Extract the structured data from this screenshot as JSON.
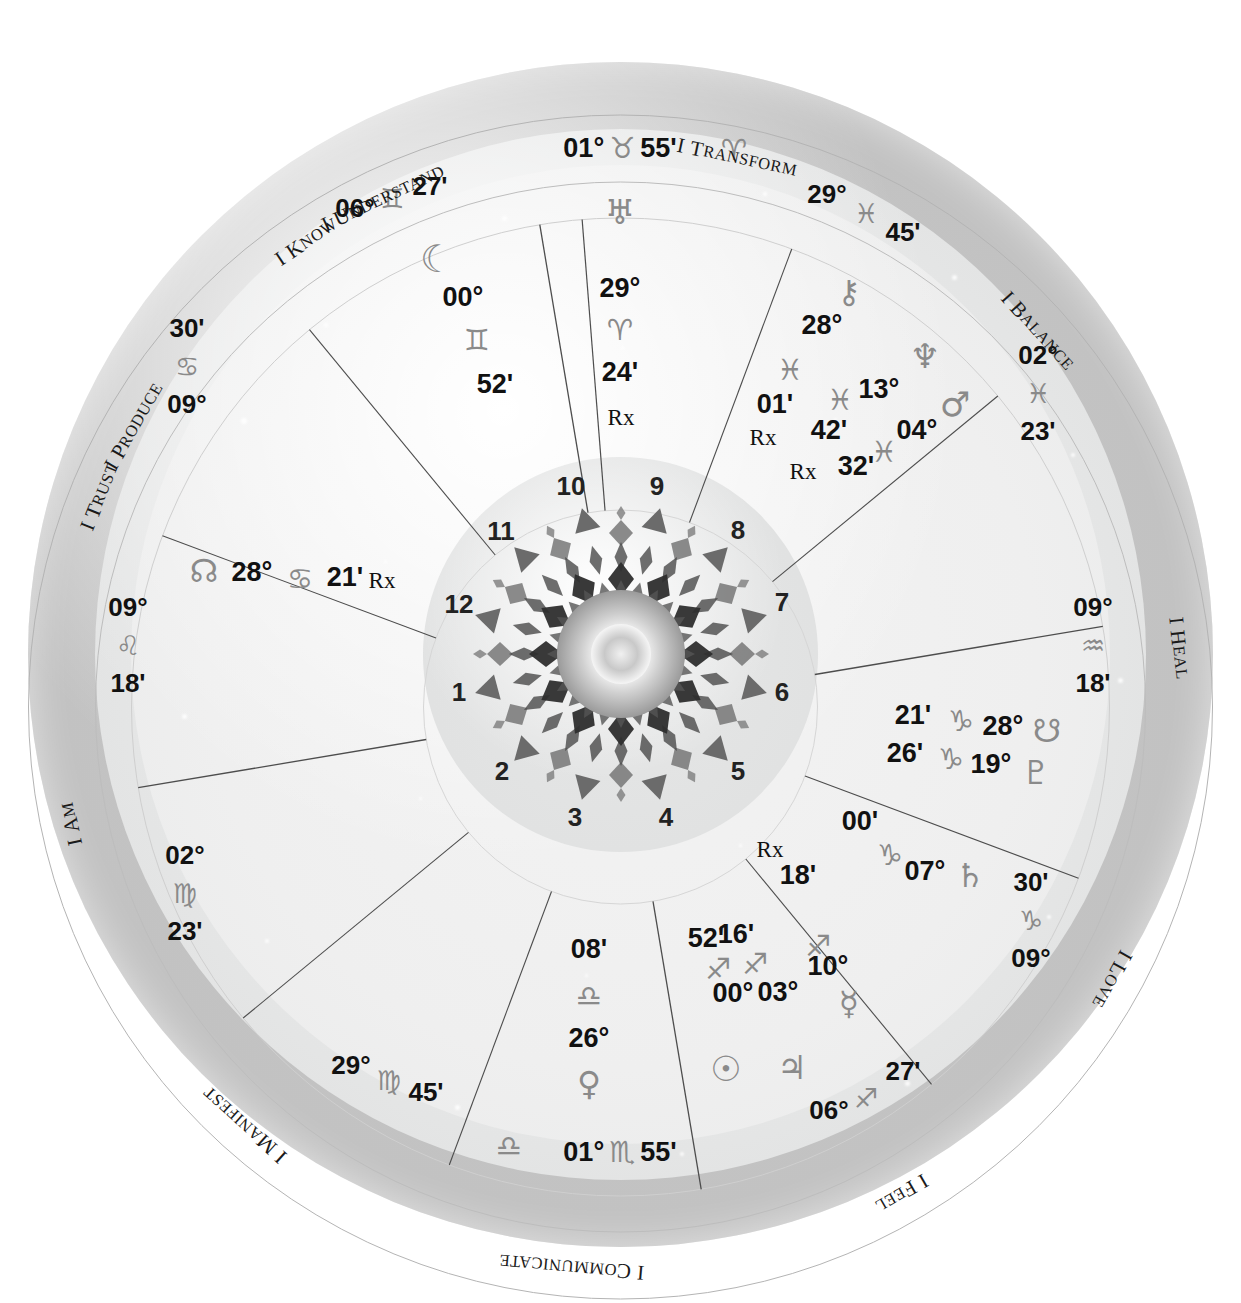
{
  "chart": {
    "type": "natal-wheel",
    "house_system": "12 equal sectors",
    "colors": {
      "text": "#111111",
      "glyph": "#8a8a8a",
      "outer_ring": "#c4c4c4",
      "zodiac_ring": "#e7e8e8",
      "house_ring": "#efefef",
      "inner_disc": "#e1e2e2",
      "line": "#555555"
    }
  },
  "keywords": [
    {
      "label": "I Produce",
      "angle": -60
    },
    {
      "label": "I Understand",
      "angle": -25
    },
    {
      "label": "I Transform",
      "angle": 12
    },
    {
      "label": "I Balance",
      "angle": 48
    },
    {
      "label": "I Heal",
      "angle": 84
    },
    {
      "label": "I Love",
      "angle": 119
    },
    {
      "label": "I Feel",
      "angle": 150
    },
    {
      "label": "I Communicate",
      "angle": 185
    },
    {
      "label": "I Manifest",
      "angle": 222
    },
    {
      "label": "I Am",
      "angle": 258
    },
    {
      "label": "I Trust",
      "angle": 292
    },
    {
      "label": "I Know",
      "angle": 326
    }
  ],
  "house_numbers": [
    "1",
    "2",
    "3",
    "4",
    "5",
    "6",
    "7",
    "8",
    "9",
    "10",
    "11",
    "12"
  ],
  "angles": {
    "mc": {
      "name": "Midheaven",
      "degree": "01°",
      "sign": "taurus",
      "minute": "55'"
    },
    "ic": {
      "name": "Imum Coeli",
      "degree": "01°",
      "sign": "scorpio",
      "minute": "55'"
    },
    "asc": {
      "name": "Ascendant",
      "degree": "09°",
      "sign": "leo",
      "minute": "18'"
    },
    "dsc": {
      "name": "Descendant",
      "degree": "09°",
      "sign": "aquarius",
      "minute": "18'"
    }
  },
  "cusps": [
    {
      "house": "11",
      "degree": "06°",
      "sign": "gemini",
      "minute": "27'"
    },
    {
      "house": "10",
      "degree": "01°",
      "sign": "taurus",
      "minute": "55'"
    },
    {
      "house": "9",
      "degree": "29°",
      "sign": "pisces",
      "minute": "45'"
    },
    {
      "house": "8",
      "degree": "02°",
      "sign": "pisces",
      "minute": "23'"
    },
    {
      "house": "7",
      "degree": "09°",
      "sign": "aquarius",
      "minute": "18'"
    },
    {
      "house": "6",
      "degree": "09°",
      "sign": "capricorn",
      "minute": "30'"
    },
    {
      "house": "5",
      "degree": "06°",
      "sign": "sagittarius",
      "minute": "27'"
    },
    {
      "house": "4",
      "degree": "01°",
      "sign": "scorpio",
      "minute": "55'"
    },
    {
      "house": "3",
      "degree": "29°",
      "sign": "virgo",
      "minute": "45'"
    },
    {
      "house": "2",
      "degree": "02°",
      "sign": "virgo",
      "minute": "23'"
    },
    {
      "house": "1",
      "degree": "09°",
      "sign": "leo",
      "minute": "18'"
    },
    {
      "house": "12",
      "degree": "09°",
      "sign": "cancer",
      "minute": "30'"
    }
  ],
  "planets": [
    {
      "name": "Uranus",
      "glyph": "uranus-glyph",
      "degree": "29°",
      "sign": "aries",
      "minute": "24'",
      "retrograde": "Rx"
    },
    {
      "name": "Moon",
      "glyph": "moon-glyph",
      "degree": "00°",
      "sign": "gemini",
      "minute": "52'",
      "retrograde": ""
    },
    {
      "name": "Chiron",
      "glyph": "chiron-glyph",
      "degree": "28°",
      "sign": "pisces",
      "minute": "01'",
      "retrograde": "Rx"
    },
    {
      "name": "Neptune",
      "glyph": "neptune-glyph",
      "degree": "13°",
      "sign": "pisces",
      "minute": "42'",
      "retrograde": "Rx"
    },
    {
      "name": "Mars",
      "glyph": "mars-glyph",
      "degree": "04°",
      "sign": "pisces",
      "minute": "32'",
      "retrograde": ""
    },
    {
      "name": "North Node",
      "glyph": "north-node-glyph",
      "degree": "28°",
      "sign": "cancer",
      "minute": "21'",
      "retrograde": "Rx"
    },
    {
      "name": "South Node",
      "glyph": "south-node-glyph",
      "degree": "28°",
      "sign": "capricorn",
      "minute": "21'",
      "retrograde": ""
    },
    {
      "name": "Pluto",
      "glyph": "pluto-glyph",
      "degree": "19°",
      "sign": "capricorn",
      "minute": "26'",
      "retrograde": ""
    },
    {
      "name": "Saturn",
      "glyph": "saturn-glyph",
      "degree": "07°",
      "sign": "capricorn",
      "minute": "00'",
      "retrograde": ""
    },
    {
      "name": "Mercury",
      "glyph": "mercury-glyph",
      "degree": "10°",
      "sign": "sagittarius",
      "minute": "18'",
      "retrograde": "Rx"
    },
    {
      "name": "Jupiter",
      "glyph": "jupiter-glyph",
      "degree": "03°",
      "sign": "sagittarius",
      "minute": "16'",
      "retrograde": ""
    },
    {
      "name": "Sun",
      "glyph": "sun-glyph",
      "degree": "00°",
      "sign": "sagittarius",
      "minute": "52'",
      "retrograde": ""
    },
    {
      "name": "Venus",
      "glyph": "venus-glyph",
      "degree": "26°",
      "sign": "libra",
      "minute": "08'",
      "retrograde": ""
    }
  ],
  "sign_glyphs": {
    "aries": "♈",
    "taurus": "♉",
    "gemini": "♊",
    "cancer": "♋",
    "leo": "♌",
    "virgo": "♍",
    "libra": "♎",
    "scorpio": "♏",
    "sagittarius": "♐",
    "capricorn": "♑",
    "aquarius": "♒",
    "pisces": "♓"
  },
  "planet_glyphs": {
    "sun": "☉",
    "moon": "☾",
    "mercury": "☿",
    "venus": "♀",
    "mars": "♂",
    "jupiter": "♃",
    "saturn": "♄",
    "uranus": "♅",
    "neptune": "♆",
    "pluto": "♇",
    "chiron": "⚷",
    "north-node": "☊",
    "south-node": "☋"
  },
  "labels": {
    "mc_degree": "01°",
    "mc_sign": "♉",
    "mc_minute": "55'",
    "mc_extra_sign": "♈",
    "ic_degree": "01°",
    "ic_sign": "♏",
    "ic_minute": "55'",
    "ic_extra_sign": "♎",
    "asc_degree": "09°",
    "asc_sign": "♌",
    "asc_minute": "18'",
    "dsc_degree": "09°",
    "dsc_sign": "♒",
    "dsc_minute": "18'",
    "retrograde": "Rx"
  }
}
